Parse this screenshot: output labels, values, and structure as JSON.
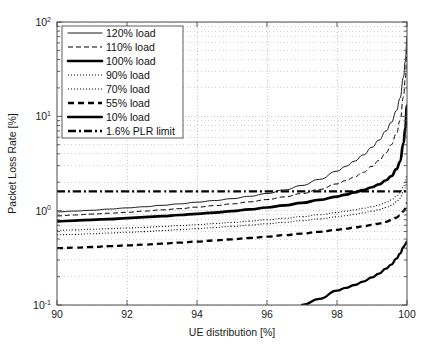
{
  "chart_data": {
    "type": "line",
    "title": "",
    "xlabel": "UE distribution [%]",
    "ylabel": "Packet Loss Rate [%]",
    "xlim": [
      90,
      100
    ],
    "ylim": [
      0.1,
      100
    ],
    "yscale": "log",
    "xscale": "linear",
    "grid": true,
    "grid_style": "dotted",
    "legend_position": "upper-left",
    "xticks": [
      "90",
      "92",
      "94",
      "96",
      "98",
      "100"
    ],
    "xtick_values": [
      90,
      92,
      94,
      96,
      98,
      100
    ],
    "ytick_labels": [
      {
        "base": "10",
        "exp": "2",
        "value": 100
      },
      {
        "base": "10",
        "exp": "1",
        "value": 10
      },
      {
        "base": "10",
        "exp": "0",
        "value": 1
      },
      {
        "base": "10",
        "exp": "-1",
        "value": 0.1
      }
    ],
    "x": [
      90,
      90.5,
      91,
      91.5,
      92,
      92.5,
      93,
      93.5,
      94,
      94.5,
      95,
      95.5,
      96,
      96.5,
      97,
      97.5,
      98,
      98.25,
      98.5,
      98.75,
      99,
      99.2,
      99.4,
      99.55,
      99.7,
      99.8,
      99.9,
      99.95,
      100
    ],
    "series": [
      {
        "name": "120% load",
        "style": "thin-solid",
        "linewidth": 0.9,
        "dash": "none",
        "values": [
          0.97,
          0.99,
          1.01,
          1.04,
          1.07,
          1.1,
          1.14,
          1.18,
          1.23,
          1.28,
          1.34,
          1.42,
          1.52,
          1.66,
          1.85,
          2.15,
          2.62,
          2.95,
          3.35,
          3.9,
          4.7,
          5.6,
          7.0,
          8.6,
          11.5,
          15.5,
          26.0,
          38.0,
          70.0
        ]
      },
      {
        "name": "110% load",
        "style": "dashed",
        "linewidth": 1.0,
        "dash": "5,3",
        "values": [
          0.88,
          0.9,
          0.92,
          0.94,
          0.96,
          0.99,
          1.02,
          1.05,
          1.09,
          1.13,
          1.18,
          1.24,
          1.31,
          1.4,
          1.52,
          1.68,
          1.92,
          2.08,
          2.28,
          2.55,
          2.95,
          3.4,
          4.1,
          5.0,
          6.6,
          9.0,
          16.0,
          25.0,
          52.0
        ]
      },
      {
        "name": "100% load",
        "style": "thick-solid",
        "linewidth": 2.6,
        "dash": "none",
        "values": [
          0.77,
          0.785,
          0.8,
          0.815,
          0.835,
          0.855,
          0.875,
          0.9,
          0.925,
          0.955,
          0.99,
          1.03,
          1.08,
          1.14,
          1.21,
          1.3,
          1.41,
          1.48,
          1.56,
          1.65,
          1.77,
          1.9,
          2.1,
          2.32,
          2.75,
          3.3,
          5.2,
          7.5,
          13.0
        ]
      },
      {
        "name": "90% load",
        "style": "fine-dotted",
        "linewidth": 1.0,
        "dash": "1,2",
        "values": [
          0.62,
          0.625,
          0.635,
          0.645,
          0.655,
          0.665,
          0.68,
          0.695,
          0.71,
          0.73,
          0.75,
          0.775,
          0.8,
          0.83,
          0.865,
          0.905,
          0.955,
          0.985,
          1.02,
          1.06,
          1.1,
          1.15,
          1.22,
          1.3,
          1.42,
          1.55,
          1.8,
          2.0,
          2.4
        ]
      },
      {
        "name": "70% load",
        "style": "fine-dotted",
        "linewidth": 1.0,
        "dash": "1,2",
        "values": [
          0.555,
          0.56,
          0.57,
          0.58,
          0.59,
          0.6,
          0.615,
          0.63,
          0.645,
          0.662,
          0.682,
          0.703,
          0.727,
          0.753,
          0.783,
          0.818,
          0.86,
          0.885,
          0.915,
          0.948,
          0.985,
          1.025,
          1.08,
          1.14,
          1.24,
          1.35,
          1.58,
          1.75,
          2.1
        ]
      },
      {
        "name": "55% load",
        "style": "thick-dashed",
        "linewidth": 2.3,
        "dash": "6,4",
        "values": [
          0.4,
          0.405,
          0.412,
          0.42,
          0.428,
          0.437,
          0.447,
          0.458,
          0.47,
          0.483,
          0.497,
          0.513,
          0.53,
          0.55,
          0.572,
          0.597,
          0.627,
          0.645,
          0.663,
          0.684,
          0.707,
          0.73,
          0.762,
          0.795,
          0.845,
          0.895,
          0.985,
          1.05,
          1.2
        ]
      },
      {
        "name": "10% load",
        "style": "medium-solid",
        "linewidth": 2.3,
        "dash": "none",
        "values": [
          null,
          null,
          null,
          null,
          null,
          null,
          null,
          null,
          null,
          null,
          null,
          null,
          null,
          null,
          0.1,
          0.116,
          0.142,
          0.152,
          0.163,
          0.177,
          0.196,
          0.215,
          0.243,
          0.268,
          0.31,
          0.35,
          0.41,
          0.44,
          0.47
        ]
      },
      {
        "name": "1.6% PLR limit",
        "style": "dash-dot",
        "linewidth": 2.3,
        "dash": "7,3,2,3",
        "constant": 1.6,
        "values": [
          1.6,
          1.6,
          1.6,
          1.6,
          1.6,
          1.6,
          1.6,
          1.6,
          1.6,
          1.6,
          1.6,
          1.6,
          1.6,
          1.6,
          1.6,
          1.6,
          1.6,
          1.6,
          1.6,
          1.6,
          1.6,
          1.6,
          1.6,
          1.6,
          1.6,
          1.6,
          1.6,
          1.6,
          1.6
        ]
      }
    ],
    "legend": [
      {
        "label": "120% load",
        "style": "thin-solid"
      },
      {
        "label": "110% load",
        "style": "dashed"
      },
      {
        "label": "100% load",
        "style": "thick-solid"
      },
      {
        "label": "90% load",
        "style": "fine-dotted"
      },
      {
        "label": "70% load",
        "style": "fine-dotted"
      },
      {
        "label": "55% load",
        "style": "thick-dashed"
      },
      {
        "label": "10% load",
        "style": "medium-solid"
      },
      {
        "label": "1.6% PLR limit",
        "style": "dash-dot"
      }
    ],
    "colors": {
      "line": "#000000",
      "grid": "#b4b4b4",
      "axis": "#4d4d4d",
      "background": "#ffffff",
      "text": "#111111"
    }
  }
}
